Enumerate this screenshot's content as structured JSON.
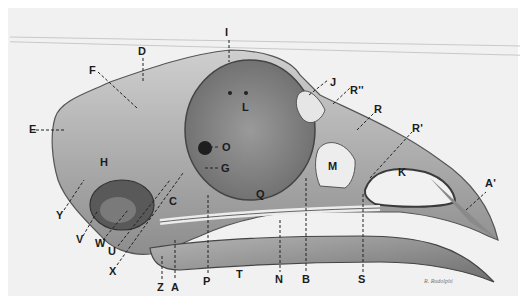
{
  "figure": {
    "signature": "R. Rudolphi",
    "colors": {
      "background": "#f1f1f1",
      "bone_light": "#d9d9d9",
      "bone_mid": "#a8a8a8",
      "bone_dark": "#555555",
      "label": "#1c1c1c"
    }
  },
  "labels": {
    "I": "I",
    "D": "D",
    "F": "F",
    "E": "E",
    "L": "L",
    "O": "O",
    "G": "G",
    "H": "H",
    "Y": "Y",
    "V": "V",
    "W": "W",
    "U": "U",
    "X": "X",
    "C": "C",
    "Z": "Z",
    "A": "A",
    "P": "P",
    "T": "T",
    "N": "N",
    "B": "B",
    "Q": "Q",
    "M": "M",
    "S": "S",
    "J": "J",
    "R2": "R''",
    "R": "R",
    "R1": "R'",
    "K": "K",
    "A1": "A'"
  }
}
